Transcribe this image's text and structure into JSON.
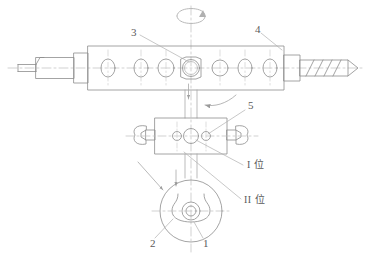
{
  "figure": {
    "title": "",
    "type": "mechanical-patent-drawing",
    "background_color": "#ffffff",
    "line_color": "#8d8d8d",
    "centerline_color": "#b5b5b5",
    "text_color": "#5a5a5a",
    "width": 370,
    "height": 259
  },
  "callouts": [
    {
      "id": "c3",
      "label": "3",
      "x": 133,
      "y": 31,
      "leader_to_x": 191,
      "leader_to_y": 63
    },
    {
      "id": "c4",
      "label": "4",
      "x": 255,
      "y": 28,
      "leader_to_x": 283,
      "leader_to_y": 52
    },
    {
      "id": "c5",
      "label": "5",
      "x": 248,
      "y": 104,
      "leader_to_x": 205,
      "leader_to_y": 135
    },
    {
      "id": "c1",
      "label": "1",
      "x": 203,
      "y": 243,
      "leader_to_x": 191,
      "leader_to_y": 222
    },
    {
      "id": "c2",
      "label": "2",
      "x": 152,
      "y": 243,
      "leader_to_x": 172,
      "leader_to_y": 218
    }
  ],
  "position_labels": [
    {
      "id": "pos1",
      "label": "I 位",
      "x": 247,
      "y": 165,
      "leader_to_x": 196,
      "leader_to_y": 140
    },
    {
      "id": "pos2",
      "label": "II 位",
      "x": 245,
      "y": 200,
      "leader_to_x": 185,
      "leader_to_y": 152
    }
  ],
  "top_assembly": {
    "name": "horizontal-shaft-bar",
    "holes_count": 7,
    "highlighted_hole_index": 3,
    "left_tip": "chamfered-stub",
    "right_tip": "threaded-point"
  },
  "middle_assembly": {
    "name": "clamp-fixture",
    "bores": 3,
    "jaws": 2
  },
  "bottom_assembly": {
    "name": "rotary-chuck-front-view",
    "outer_circle": true,
    "inner_hub": true
  },
  "rotation_arrow": {
    "name": "rotation-indicator",
    "location": "top-center"
  }
}
